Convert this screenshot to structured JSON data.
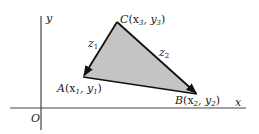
{
  "diagram": {
    "axes": {
      "x_label": "x",
      "y_label": "y",
      "origin_label": "O"
    },
    "vertices": {
      "A": {
        "name": "A",
        "coords": "(x",
        "sub1": "1",
        "sep": ", y",
        "sub2": "1",
        "close": ")"
      },
      "B": {
        "name": "B",
        "coords": "(x",
        "sub1": "2",
        "sep": ", y",
        "sub2": "2",
        "close": ")"
      },
      "C": {
        "name": "C",
        "coords": "(x",
        "sub1": "3",
        "sep": ", y",
        "sub2": "3",
        "close": ")"
      }
    },
    "edges": {
      "z1": {
        "name": "z",
        "sub": "1"
      },
      "z2": {
        "name": "z",
        "sub": "2"
      }
    },
    "colors": {
      "fill": "#c4c4c4",
      "stroke": "#111111",
      "axis": "#333333"
    }
  }
}
